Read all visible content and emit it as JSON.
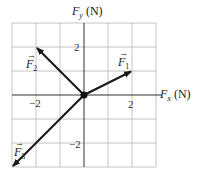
{
  "figure": {
    "type": "vector-diagram",
    "y_axis_label": {
      "symbol": "F",
      "subscript": "y",
      "unit": "(N)"
    },
    "x_axis_label": {
      "symbol": "F",
      "subscript": "x",
      "unit": "(N)"
    },
    "ticks": {
      "y_pos": "2",
      "y_neg": "−2",
      "x_pos": "2",
      "x_neg": "−2"
    },
    "grid": {
      "x_range": [
        -3,
        3
      ],
      "y_range": [
        -3,
        3
      ],
      "step": 1
    },
    "vectors": [
      {
        "name": "F1",
        "symbol": "F",
        "subscript": "1",
        "arrow": "→",
        "from": [
          0,
          0
        ],
        "to": [
          2,
          1
        ]
      },
      {
        "name": "F2",
        "symbol": "F",
        "subscript": "2",
        "arrow": "→",
        "from": [
          0,
          0
        ],
        "to": [
          -2,
          2
        ]
      },
      {
        "name": "F3",
        "symbol": "F",
        "subscript": "3",
        "arrow": "→",
        "from": [
          0,
          0
        ],
        "to": [
          -3,
          -3
        ]
      }
    ],
    "colors": {
      "grid": "#b5b5b5",
      "axis": "#333333",
      "vector": "#1a1a1a"
    }
  }
}
